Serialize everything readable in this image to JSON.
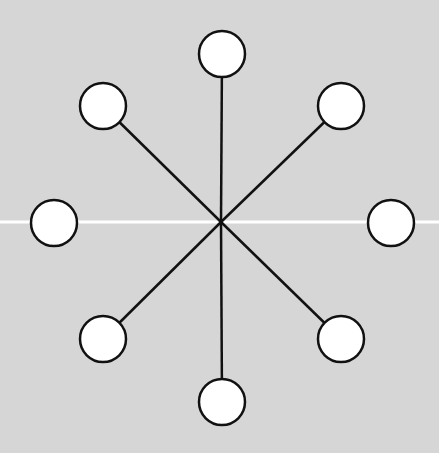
{
  "diagram": {
    "type": "star-graph",
    "background": "#d6d6d6",
    "guide_line": {
      "y": 222,
      "color": "#ffffff"
    },
    "center": {
      "x": 221,
      "y": 222
    },
    "node_radius": 23,
    "stroke_color": "#111111",
    "node_fill": "#ffffff",
    "nodes": [
      {
        "id": "top",
        "x": 222,
        "y": 54,
        "connected": true
      },
      {
        "id": "top-right",
        "x": 341,
        "y": 106,
        "connected": true
      },
      {
        "id": "right",
        "x": 391,
        "y": 223,
        "connected": false
      },
      {
        "id": "bottom-right",
        "x": 341,
        "y": 339,
        "connected": true
      },
      {
        "id": "bottom",
        "x": 222,
        "y": 402,
        "connected": true
      },
      {
        "id": "bottom-left",
        "x": 103,
        "y": 339,
        "connected": true
      },
      {
        "id": "left",
        "x": 54,
        "y": 223,
        "connected": false
      },
      {
        "id": "top-left",
        "x": 103,
        "y": 106,
        "connected": true
      }
    ]
  }
}
